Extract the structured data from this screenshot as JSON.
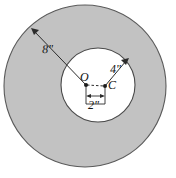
{
  "figure": {
    "type": "geometry-diagram",
    "colors": {
      "shaded_region": "#c2c2c2",
      "inner_region": "#ffffff",
      "stroke": "#3a3a3a",
      "background": "#ffffff",
      "label_text": "#111111"
    },
    "outer_circle": {
      "name": "outer-circle",
      "center_label": "O",
      "radius_label": "8\"",
      "radius_value": 8,
      "units": "inches",
      "cx": 85,
      "cy": 86,
      "r": 81
    },
    "inner_circle": {
      "name": "inner-circle",
      "center_label": "C",
      "radius_label": "4\"",
      "radius_value": 4,
      "units": "inches",
      "cx": 98,
      "cy": 85,
      "r": 37
    },
    "center_offset": {
      "name": "center-separation",
      "label": "2\"",
      "value": 2,
      "units": "inches",
      "from": "O",
      "to": "C"
    },
    "points": [
      {
        "label": "O",
        "x": 86,
        "y": 85,
        "role": "outer-circle-center"
      },
      {
        "label": "C",
        "x": 105,
        "y": 86,
        "role": "inner-circle-center"
      }
    ],
    "leaders": [
      {
        "name": "radius-8-leader",
        "label": "8\"",
        "from_x": 86,
        "from_y": 85,
        "to_x": 32,
        "to_y": 29
      },
      {
        "name": "radius-4-leader",
        "label": "4\"",
        "from_x": 105,
        "from_y": 86,
        "to_x": 128,
        "to_y": 59
      }
    ]
  }
}
